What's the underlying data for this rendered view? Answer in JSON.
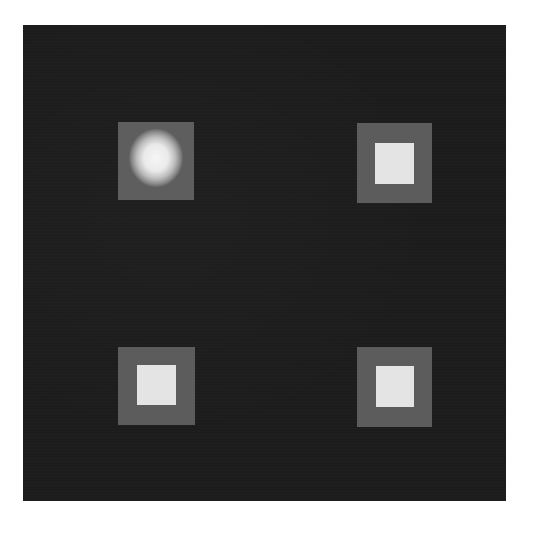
{
  "image": {
    "background_color": "#ffffff",
    "panel": {
      "color": "#1c1c1c",
      "x": 23,
      "y": 25,
      "width": 483,
      "height": 476
    },
    "patches": [
      {
        "position": "top-left",
        "outer": {
          "x": 118,
          "y": 122,
          "width": 76,
          "height": 78,
          "color": "#5e5e5e"
        },
        "inner": {
          "style": "blurred-glow",
          "color": "#f4f4f4"
        }
      },
      {
        "position": "top-right",
        "outer": {
          "x": 357,
          "y": 123,
          "width": 75,
          "height": 80,
          "color": "#5c5c5c"
        },
        "inner": {
          "x": 375,
          "y": 143,
          "width": 39,
          "height": 41,
          "color": "#e4e4e4"
        }
      },
      {
        "position": "bottom-left",
        "outer": {
          "x": 118,
          "y": 347,
          "width": 77,
          "height": 78,
          "color": "#5c5c5c"
        },
        "inner": {
          "x": 137,
          "y": 365,
          "width": 39,
          "height": 40,
          "color": "#e4e4e4"
        }
      },
      {
        "position": "bottom-right",
        "outer": {
          "x": 357,
          "y": 347,
          "width": 75,
          "height": 80,
          "color": "#5c5c5c"
        },
        "inner": {
          "x": 376,
          "y": 366,
          "width": 38,
          "height": 41,
          "color": "#e4e4e4"
        }
      }
    ]
  }
}
